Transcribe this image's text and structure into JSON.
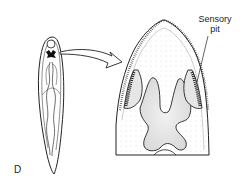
{
  "figure": {
    "panel_label": "D",
    "annotations": [
      {
        "text_line1": "Sensory",
        "text_line2": "pit"
      }
    ],
    "subjects": [
      {
        "name": "whole-planarian",
        "description": "elongated flatworm body with branched gut"
      },
      {
        "name": "head-enlargement",
        "description": "magnified head region showing sensory pits"
      }
    ],
    "colors": {
      "ink": "#222222",
      "stipple": "#bbbbbb",
      "background": "#ffffff"
    }
  }
}
